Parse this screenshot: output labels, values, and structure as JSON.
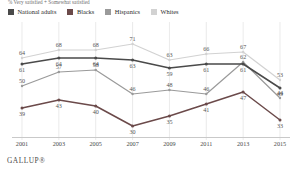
{
  "subtitle": "% Very satisfied + Somewhat satisfied",
  "brand": "GALLUP®",
  "legend": [
    {
      "label": "National adults",
      "color": "#4a4a4a"
    },
    {
      "label": "Blacks",
      "color": "#6b4a4a"
    },
    {
      "label": "Hispanics",
      "color": "#9a9a9a"
    },
    {
      "label": "Whites",
      "color": "#d2d2d2"
    }
  ],
  "chart_data": {
    "type": "line",
    "title": "",
    "subtitle": "% Very satisfied + Somewhat satisfied",
    "xlabel": "",
    "ylabel": "",
    "ylim": [
      25,
      75
    ],
    "grid": "vertical",
    "legend_position": "top-left",
    "categories": [
      "2001",
      "2003",
      "2005",
      "2007",
      "2009",
      "2011",
      "2013",
      "2015"
    ],
    "series": [
      {
        "name": "National adults",
        "color": "#4a4a4a",
        "values": [
          61,
          64,
          64,
          63,
          59,
          61,
          61,
          49
        ],
        "labels": [
          "61",
          "64",
          "64",
          "63",
          "59",
          "61",
          "61",
          "49"
        ]
      },
      {
        "name": "Blacks",
        "color": "#6b4a4a",
        "values": [
          39,
          43,
          40,
          30,
          35,
          41,
          47,
          33
        ],
        "labels": [
          "39",
          "43",
          "40",
          "30",
          "35",
          "41",
          "47",
          "33"
        ]
      },
      {
        "name": "Hispanics",
        "color": "#9a9a9a",
        "values": [
          50,
          57,
          58,
          46,
          48,
          46,
          62,
          44
        ],
        "labels": [
          "50",
          "57",
          "58",
          "46",
          "48",
          "46",
          "62",
          "44"
        ]
      },
      {
        "name": "Whites",
        "color": "#d2d2d2",
        "values": [
          64,
          68,
          68,
          71,
          63,
          66,
          67,
          53
        ],
        "labels": [
          "64",
          "68",
          "68",
          "71",
          "63",
          "66",
          "67",
          "53"
        ]
      }
    ],
    "extra_point_labels": [
      {
        "text": "66",
        "x": 2006,
        "y": 66.5,
        "series": "Whites"
      },
      {
        "text": "66",
        "x": 2007,
        "y": 66.5,
        "series": "Whites"
      },
      {
        "text": "41",
        "x": 2006,
        "y": 41,
        "series": "Blacks"
      },
      {
        "text": "45",
        "x": 2006,
        "y": 45,
        "series": "Hispanics"
      },
      {
        "text": "46",
        "x": 2008,
        "y": 46,
        "series": "Hispanics"
      },
      {
        "text": "37",
        "x": 2008,
        "y": 37,
        "series": "Blacks"
      }
    ]
  }
}
